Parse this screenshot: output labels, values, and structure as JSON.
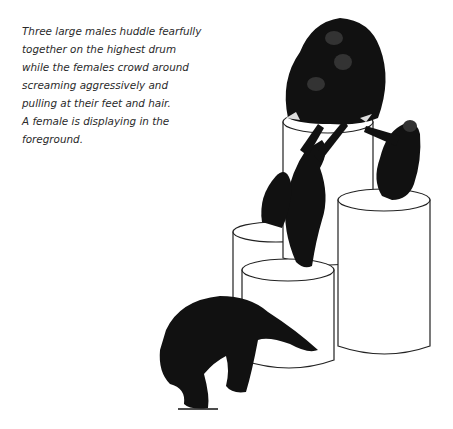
{
  "illustration": {
    "subject": "chimpanzees on drums",
    "caption_lines": [
      "Three large males huddle fearfully",
      "together on the highest drum",
      "while the females crowd around",
      "screaming aggressively and",
      "pulling at their feet and hair.",
      "A female is displaying in the",
      "foreground."
    ]
  }
}
